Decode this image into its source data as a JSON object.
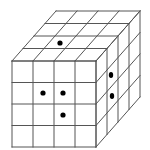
{
  "diagram": {
    "type": "cube-grid",
    "grid_size": 4,
    "line_color": "#555555",
    "dot_color": "#000000",
    "background": "#ffffff",
    "front_face": {
      "x": 12,
      "y": 61,
      "width": 84,
      "height": 86
    },
    "depth_vector": {
      "dx": 44,
      "dy": -50
    },
    "dots": {
      "top": [
        {
          "row_from_front": 1,
          "col": 1
        }
      ],
      "front": [
        {
          "row": 1,
          "col": 1
        },
        {
          "row": 1,
          "col": 2
        },
        {
          "row": 2,
          "col": 2
        }
      ],
      "right": [
        {
          "row": 0,
          "depth": 1
        },
        {
          "row": 1,
          "depth": 1
        }
      ]
    },
    "dot_points": [
      {
        "face": "top",
        "x": 60,
        "y": 43
      },
      {
        "face": "front",
        "x": 43,
        "y": 93
      },
      {
        "face": "front",
        "x": 63,
        "y": 93
      },
      {
        "face": "front",
        "x": 63,
        "y": 115
      },
      {
        "face": "right",
        "x": 111,
        "y": 75
      },
      {
        "face": "right",
        "x": 112,
        "y": 96
      }
    ]
  }
}
